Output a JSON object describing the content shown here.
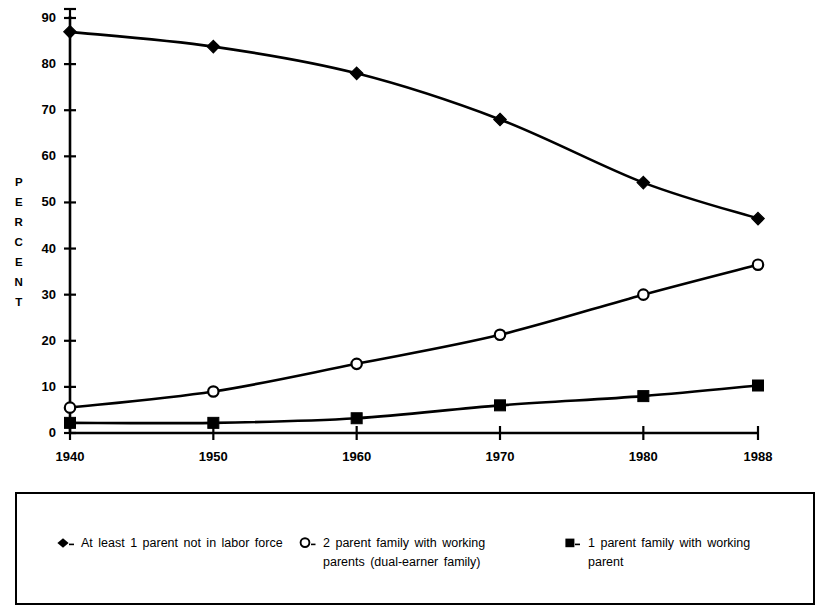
{
  "chart_data": {
    "type": "line",
    "title": "",
    "subtitle": "",
    "xlabel": "",
    "ylabel": "PERCENT",
    "ylabel_letters": [
      "P",
      "E",
      "R",
      "C",
      "E",
      "N",
      "T"
    ],
    "x": [
      1940,
      1950,
      1960,
      1970,
      1980,
      1988
    ],
    "categories": [
      "1940",
      "1950",
      "1960",
      "1970",
      "1980",
      "1988"
    ],
    "xlim": [
      1940,
      1988
    ],
    "ylim": [
      0,
      90
    ],
    "y_ticks": [
      0,
      10,
      20,
      30,
      40,
      50,
      60,
      70,
      80,
      90
    ],
    "y_tick_labels": [
      "0",
      "10",
      "20",
      "30",
      "40",
      "50",
      "60",
      "70",
      "80",
      "90"
    ],
    "x_ticks": [
      1940,
      1950,
      1960,
      1970,
      1980,
      1988
    ],
    "x_tick_labels": [
      "1940",
      "1950",
      "1960",
      "1970",
      "1980",
      "1988"
    ],
    "grid": false,
    "legend_position": "below-plot-boxed",
    "series": [
      {
        "name": "At least 1 parent not in labor force",
        "marker": "filled-diamond",
        "color": "#000000",
        "values": [
          87,
          83.8,
          78,
          68,
          54.3,
          46.5
        ]
      },
      {
        "name": "2 parent family with working parents (dual-earner family)",
        "marker": "open-circle",
        "color": "#000000",
        "values": [
          5.5,
          9,
          15,
          21.3,
          30,
          36.5
        ]
      },
      {
        "name": "1 parent family with working parent",
        "marker": "filled-square",
        "color": "#000000",
        "values": [
          2.2,
          2.2,
          3.2,
          6,
          8,
          10.3
        ]
      }
    ]
  },
  "legend": {
    "entries": [
      {
        "marker": "filled-diamond",
        "label": "At least 1 parent not in labor force"
      },
      {
        "marker": "open-circle",
        "label": "2 parent family with working\nparents (dual-earner family)"
      },
      {
        "marker": "filled-square",
        "label": "1 parent family with working\nparent"
      }
    ]
  },
  "colors": {
    "ink": "#000000",
    "background": "#ffffff"
  }
}
